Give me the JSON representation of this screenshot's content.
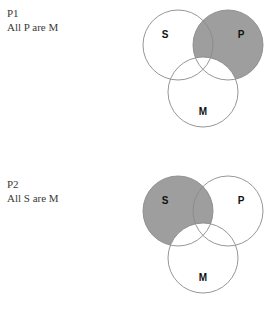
{
  "page": {
    "background_color": "#ffffff",
    "text_color": "#3a3a3a"
  },
  "style": {
    "shade_color": "#9e9e9e",
    "circle_stroke_color": "#8a8a8a",
    "letter_color": "#111111"
  },
  "premises": [
    {
      "tag": "P1",
      "text": "All P are M",
      "diagram": {
        "circles": [
          {
            "label": "S",
            "cx": 38,
            "cy": 43,
            "r": 35,
            "label_x": 25,
            "label_y": 33
          },
          {
            "label": "P",
            "cx": 88,
            "cy": 43,
            "r": 35,
            "label_x": 101,
            "label_y": 33
          },
          {
            "label": "M",
            "cx": 63,
            "cy": 90,
            "r": 35,
            "label_x": 63,
            "label_y": 110
          }
        ],
        "shaded_region": "P-minus-M",
        "shaded_description": "P circle shaded except where it overlaps M"
      }
    },
    {
      "tag": "P2",
      "text": "All S are M",
      "diagram": {
        "circles": [
          {
            "label": "S",
            "cx": 38,
            "cy": 43,
            "r": 35,
            "label_x": 25,
            "label_y": 33
          },
          {
            "label": "P",
            "cx": 88,
            "cy": 43,
            "r": 35,
            "label_x": 101,
            "label_y": 33
          },
          {
            "label": "M",
            "cx": 63,
            "cy": 90,
            "r": 35,
            "label_x": 63,
            "label_y": 110
          }
        ],
        "shaded_region": "S-minus-M",
        "shaded_description": "S circle shaded except where it overlaps M"
      }
    }
  ]
}
